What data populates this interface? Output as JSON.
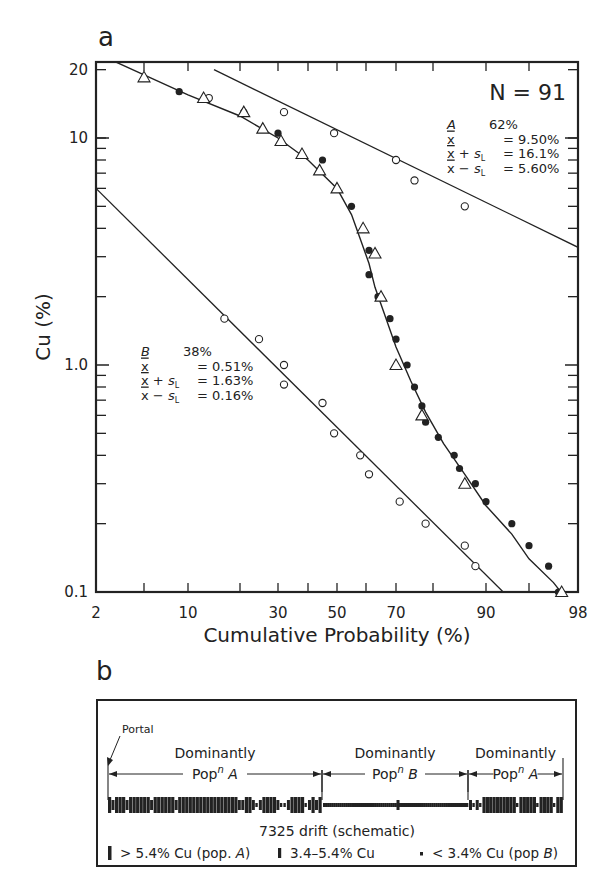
{
  "chart_data": [
    {
      "panel": "a",
      "type": "scatter",
      "title": "",
      "xlabel": "Cumulative Probability (%)",
      "ylabel": "Cu (%)",
      "x_scale": "probability",
      "y_scale": "log",
      "xlim": [
        2,
        98
      ],
      "ylim": [
        0.1,
        20
      ],
      "x_tick_labels": [
        "2",
        "10",
        "30",
        "50",
        "70",
        "90",
        "98"
      ],
      "y_tick_labels": [
        "20",
        "10",
        "1.0",
        "0.1"
      ],
      "grid": false,
      "annotation_N": "N = 91",
      "population_A": {
        "label": "A",
        "percent": "62%",
        "mean": "= 9.50%",
        "mean_plus_sL": "= 16.1%",
        "mean_minus_sL": "= 5.60%"
      },
      "population_B": {
        "label": "B",
        "percent": "38%",
        "mean": "= 0.51%",
        "mean_plus_sL": "= 1.63%",
        "mean_minus_sL": "= 0.16%"
      },
      "series": [
        {
          "name": "Population A (open circles)",
          "marker": "open-circle",
          "points": [
            [
              14,
              15
            ],
            [
              32,
              13
            ],
            [
              49,
              10.5
            ],
            [
              70,
              8
            ],
            [
              75,
              6.5
            ],
            [
              86,
              5
            ]
          ]
        },
        {
          "name": "Population B (open circles)",
          "marker": "open-circle",
          "points": [
            [
              17,
              1.6
            ],
            [
              25,
              1.3
            ],
            [
              32,
              1.0
            ],
            [
              32,
              0.82
            ],
            [
              45,
              0.68
            ],
            [
              49,
              0.5
            ],
            [
              58,
              0.4
            ],
            [
              61,
              0.33
            ],
            [
              71,
              0.25
            ],
            [
              78,
              0.2
            ],
            [
              86,
              0.16
            ],
            [
              88,
              0.13
            ]
          ]
        },
        {
          "name": "Combined data (filled circles)",
          "marker": "filled-circle",
          "points": [
            [
              9,
              16
            ],
            [
              21,
              13
            ],
            [
              30,
              10.5
            ],
            [
              45,
              8
            ],
            [
              55,
              5
            ],
            [
              61,
              3.2
            ],
            [
              61,
              2.5
            ],
            [
              64,
              2.0
            ],
            [
              68,
              1.6
            ],
            [
              70,
              1.3
            ],
            [
              73,
              1.0
            ],
            [
              75,
              0.8
            ],
            [
              77,
              0.66
            ],
            [
              78,
              0.56
            ],
            [
              81,
              0.48
            ],
            [
              84,
              0.4
            ],
            [
              85,
              0.35
            ],
            [
              88,
              0.3
            ],
            [
              90,
              0.25
            ],
            [
              93,
              0.2
            ],
            [
              95,
              0.16
            ],
            [
              96.2,
              0.13
            ],
            [
              96.8,
              0.1
            ]
          ]
        },
        {
          "name": "Combined data (triangles)",
          "marker": "open-triangle",
          "points": [
            [
              5,
              18.5
            ],
            [
              13,
              15
            ],
            [
              21,
              13
            ],
            [
              26,
              11
            ],
            [
              31,
              9.7
            ],
            [
              38,
              8.5
            ],
            [
              44,
              7.2
            ],
            [
              50,
              6
            ],
            [
              59,
              4
            ],
            [
              63,
              3.1
            ],
            [
              65,
              2.0
            ],
            [
              70,
              1.0
            ],
            [
              77,
              0.6
            ],
            [
              86,
              0.3
            ],
            [
              97,
              0.1
            ]
          ]
        }
      ],
      "fit_lines": [
        {
          "name": "Population A line",
          "from": [
            15,
            20
          ],
          "to": [
            98,
            3.3
          ]
        },
        {
          "name": "Population B line",
          "from": [
            2,
            6
          ],
          "to": [
            92,
            0.1
          ]
        },
        {
          "name": "Mixture curve",
          "type": "curve"
        }
      ]
    },
    {
      "panel": "b",
      "type": "schematic",
      "title": "7325 drift (schematic)",
      "portal_label": "Portal",
      "zones": [
        {
          "line1": "Dominantly",
          "line2": "Pop",
          "sup": "n",
          "pop": "A"
        },
        {
          "line1": "Dominantly",
          "line2": "Pop",
          "sup": "n",
          "pop": "B"
        },
        {
          "line1": "Dominantly",
          "line2": "Pop",
          "sup": "n",
          "pop": "A"
        }
      ],
      "legend": [
        {
          "symbol": "tall-bar",
          "text": "> 5.4% Cu (pop. ",
          "pop": "A",
          "suffix": ")"
        },
        {
          "symbol": "medium-bar",
          "text": "3.4–5.4% Cu",
          "pop": "",
          "suffix": ""
        },
        {
          "symbol": "small-square",
          "text": "< 3.4% Cu (pop ",
          "pop": "B",
          "suffix": ")"
        }
      ]
    }
  ],
  "labels": {
    "panel_a": "a",
    "panel_b": "b"
  }
}
